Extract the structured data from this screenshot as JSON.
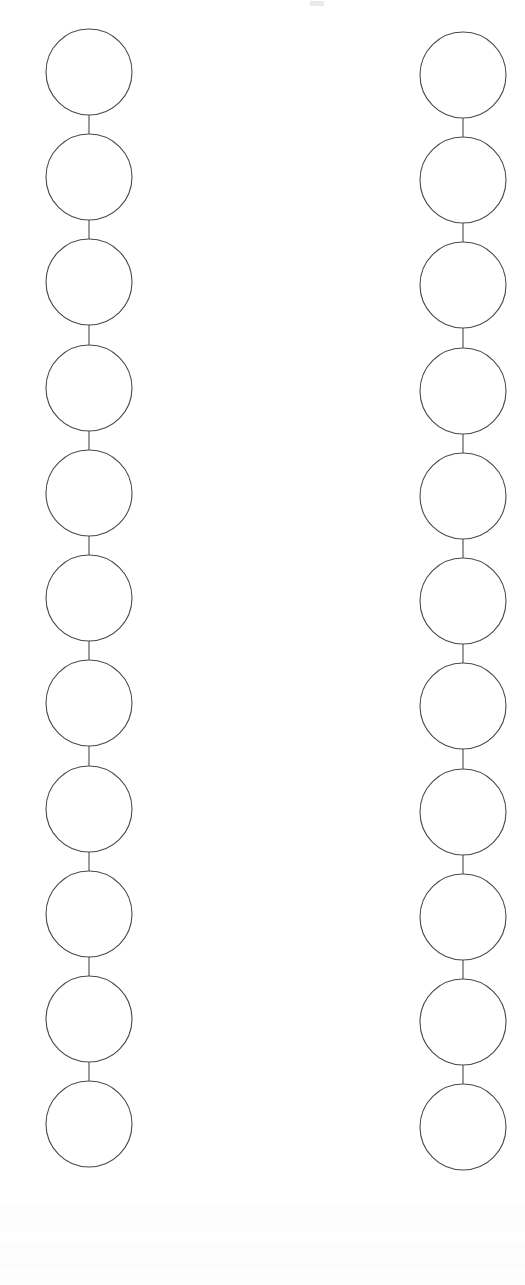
{
  "page": {
    "width": 525,
    "height": 1285,
    "background_color": "#ffffff",
    "kind": "line-diagram"
  },
  "style": {
    "stroke_color": "#4a4a4a",
    "stroke_width": 1.1,
    "fill_color": "#ffffff",
    "link_stroke_color": "#4a4a4a",
    "link_stroke_width": 1.1
  },
  "geometry": {
    "node_radius": 43,
    "node_pitch": 105.2,
    "link_length": 19
  },
  "chains": [
    {
      "id": "left-chain",
      "label": "Left chain",
      "center_x": 89,
      "first_center_y": 72,
      "node_count": 11,
      "link_count": 10,
      "node_centers_y": [
        72,
        177,
        282,
        388,
        493,
        598,
        703,
        809,
        914,
        1019,
        1124
      ],
      "nodes": [
        {
          "index": 1,
          "cx": 89,
          "cy": 72,
          "r": 43
        },
        {
          "index": 2,
          "cx": 89,
          "cy": 177,
          "r": 43
        },
        {
          "index": 3,
          "cx": 89,
          "cy": 282,
          "r": 43
        },
        {
          "index": 4,
          "cx": 89,
          "cy": 388,
          "r": 43
        },
        {
          "index": 5,
          "cx": 89,
          "cy": 493,
          "r": 43
        },
        {
          "index": 6,
          "cx": 89,
          "cy": 598,
          "r": 43
        },
        {
          "index": 7,
          "cx": 89,
          "cy": 703,
          "r": 43
        },
        {
          "index": 8,
          "cx": 89,
          "cy": 809,
          "r": 43
        },
        {
          "index": 9,
          "cx": 89,
          "cy": 914,
          "r": 43
        },
        {
          "index": 10,
          "cx": 89,
          "cy": 1019,
          "r": 43
        },
        {
          "index": 11,
          "cx": 89,
          "cy": 1124,
          "r": 43
        }
      ],
      "links": [
        {
          "index": 1,
          "x": 89,
          "y1": 115,
          "y2": 134
        },
        {
          "index": 2,
          "x": 89,
          "y1": 220,
          "y2": 239
        },
        {
          "index": 3,
          "x": 89,
          "y1": 325,
          "y2": 345
        },
        {
          "index": 4,
          "x": 89,
          "y1": 431,
          "y2": 450
        },
        {
          "index": 5,
          "x": 89,
          "y1": 536,
          "y2": 555
        },
        {
          "index": 6,
          "x": 89,
          "y1": 641,
          "y2": 660
        },
        {
          "index": 7,
          "x": 89,
          "y1": 746,
          "y2": 766
        },
        {
          "index": 8,
          "x": 89,
          "y1": 852,
          "y2": 871
        },
        {
          "index": 9,
          "x": 89,
          "y1": 957,
          "y2": 976
        },
        {
          "index": 10,
          "x": 89,
          "y1": 1062,
          "y2": 1081
        }
      ]
    },
    {
      "id": "right-chain",
      "label": "Right chain",
      "center_x": 463,
      "first_center_y": 75,
      "node_count": 11,
      "link_count": 10,
      "node_centers_y": [
        75,
        180,
        285,
        391,
        496,
        601,
        706,
        812,
        917,
        1022,
        1127
      ],
      "nodes": [
        {
          "index": 1,
          "cx": 463,
          "cy": 75,
          "r": 43
        },
        {
          "index": 2,
          "cx": 463,
          "cy": 180,
          "r": 43
        },
        {
          "index": 3,
          "cx": 463,
          "cy": 285,
          "r": 43
        },
        {
          "index": 4,
          "cx": 463,
          "cy": 391,
          "r": 43
        },
        {
          "index": 5,
          "cx": 463,
          "cy": 496,
          "r": 43
        },
        {
          "index": 6,
          "cx": 463,
          "cy": 601,
          "r": 43
        },
        {
          "index": 7,
          "cx": 463,
          "cy": 706,
          "r": 43
        },
        {
          "index": 8,
          "cx": 463,
          "cy": 812,
          "r": 43
        },
        {
          "index": 9,
          "cx": 463,
          "cy": 917,
          "r": 43
        },
        {
          "index": 10,
          "cx": 463,
          "cy": 1022,
          "r": 43
        },
        {
          "index": 11,
          "cx": 463,
          "cy": 1127,
          "r": 43
        }
      ],
      "links": [
        {
          "index": 1,
          "x": 463,
          "y1": 118,
          "y2": 137
        },
        {
          "index": 2,
          "x": 463,
          "y1": 223,
          "y2": 242
        },
        {
          "index": 3,
          "x": 463,
          "y1": 328,
          "y2": 348
        },
        {
          "index": 4,
          "x": 463,
          "y1": 434,
          "y2": 453
        },
        {
          "index": 5,
          "x": 463,
          "y1": 539,
          "y2": 558
        },
        {
          "index": 6,
          "x": 463,
          "y1": 644,
          "y2": 663
        },
        {
          "index": 7,
          "x": 463,
          "y1": 749,
          "y2": 769
        },
        {
          "index": 8,
          "x": 463,
          "y1": 855,
          "y2": 874
        },
        {
          "index": 9,
          "x": 463,
          "y1": 960,
          "y2": 979
        },
        {
          "index": 10,
          "x": 463,
          "y1": 1065,
          "y2": 1084
        }
      ]
    }
  ],
  "artifacts": {
    "note": "Faint scanner bleed-through ghosting, no legible text",
    "top_speck": {
      "x": 310,
      "y": 1,
      "width": 14,
      "height": 5
    },
    "ghost_bands_y": [
      1205,
      1243,
      1272
    ]
  }
}
